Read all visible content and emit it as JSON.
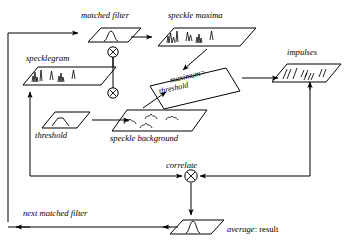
{
  "diagram": {
    "type": "flow-diagram",
    "stroke_color": "#000000",
    "background_color": "#ffffff",
    "nodes": [
      {
        "id": "matched-filter",
        "label": "matched filter",
        "shape": "parallelogram",
        "glyph": "peak-curve",
        "x": 113,
        "y": 22
      },
      {
        "id": "speckle-maxima",
        "label": "speckle maxima",
        "shape": "parallelogram",
        "glyph": "spiky-maxima",
        "x": 215,
        "y": 22
      },
      {
        "id": "specklegram",
        "label": "specklegram",
        "shape": "parallelogram",
        "glyph": "spiky-maxima",
        "x": 57,
        "y": 62
      },
      {
        "id": "maximum-threshold",
        "label_line1": "maximum>",
        "label_line2": "threshold",
        "shape": "tilted-box",
        "x": 191,
        "y": 80
      },
      {
        "id": "impulses",
        "label": "impulses",
        "shape": "parallelogram",
        "glyph": "impulse-ticks",
        "x": 305,
        "y": 62
      },
      {
        "id": "threshold",
        "label": "threshold",
        "shape": "parallelogram",
        "glyph": "hump-curve",
        "x": 57,
        "y": 118
      },
      {
        "id": "speckle-background",
        "label": "speckle background",
        "shape": "parallelogram",
        "glyph": "squiggles",
        "x": 150,
        "y": 118
      },
      {
        "id": "correlate",
        "label": "correlate",
        "shape": "circle-times",
        "glyph": "otimes",
        "x": 191,
        "y": 176
      },
      {
        "id": "average-result",
        "label": "average",
        "label_suffix": ": result",
        "shape": "parallelogram",
        "glyph": "peak-curve",
        "x": 191,
        "y": 222
      }
    ],
    "operators": [
      {
        "id": "mult-top",
        "symbol": "otimes",
        "x": 113,
        "y": 52
      },
      {
        "id": "mult-mid",
        "symbol": "otimes",
        "x": 113,
        "y": 93
      }
    ],
    "edge_labels": [
      {
        "id": "next-matched-filter",
        "label": "next matched filter",
        "x": 30,
        "y": 215
      }
    ],
    "edges": [
      {
        "from": "feedback-left",
        "to": "matched-filter",
        "style": "solid-arrow"
      },
      {
        "from": "matched-filter",
        "to": "speckle-maxima",
        "style": "solid-arrow"
      },
      {
        "from": "speckle-maxima",
        "to": "maximum-threshold",
        "style": "solid-arrow"
      },
      {
        "from": "speckle-background",
        "to": "maximum-threshold",
        "style": "solid-arrow"
      },
      {
        "from": "maximum-threshold",
        "to": "impulses",
        "style": "solid-arrow"
      },
      {
        "from": "threshold",
        "to": "speckle-background",
        "style": "solid-arrow"
      },
      {
        "from": "specklegram",
        "to": "mult-top",
        "style": "solid-line"
      },
      {
        "from": "impulses",
        "to": "correlate",
        "style": "solid-arrow"
      },
      {
        "from": "correlate",
        "to": "average-result",
        "style": "solid-arrow"
      },
      {
        "from": "average-result",
        "to": "feedback-left",
        "style": "solid-arrow"
      },
      {
        "from": "feedback-inner",
        "to": "specklegram",
        "style": "solid-arrow"
      },
      {
        "from": "feedback-inner",
        "to": "correlate",
        "style": "solid-arrow"
      }
    ]
  }
}
